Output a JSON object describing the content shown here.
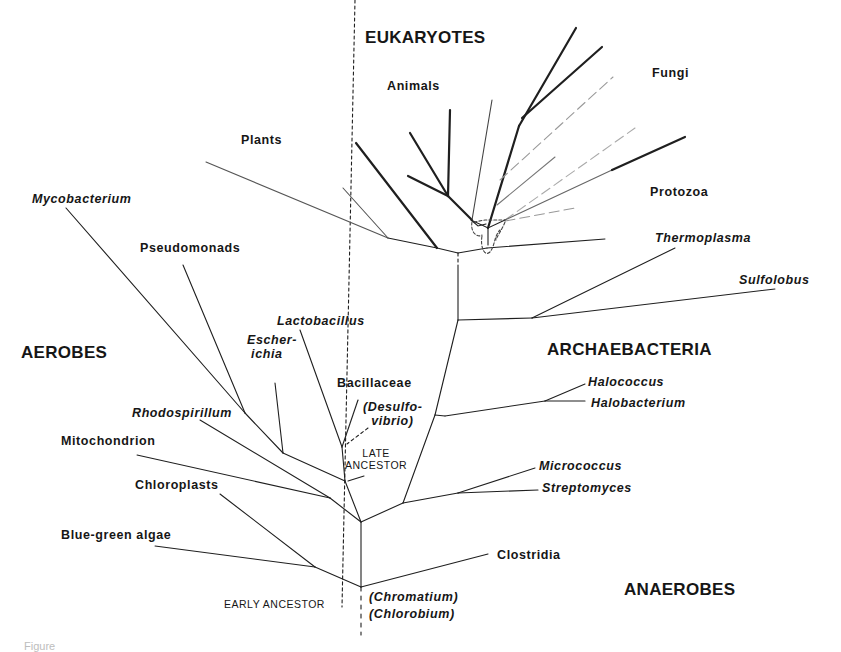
{
  "figure": {
    "groups": {
      "eukaryotes": "EUKARYOTES",
      "aerobes": "AEROBES",
      "archaebacteria": "ARCHAEBACTERIA",
      "anaerobes": "ANAEROBES"
    },
    "taxa": {
      "animals": "Animals",
      "fungi": "Fungi",
      "plants": "Plants",
      "protozoa": "Protozoa",
      "mycobacterium": "Mycobacterium",
      "pseudomonads": "Pseudomonads",
      "thermoplasma": "Thermoplasma",
      "sulfolobus": "Sulfolobus",
      "lactobacillus": "Lactobacillus",
      "escherichia": "Escher-\n ichia",
      "bacillaceae": "Bacillaceae",
      "desulfovibrio": "(Desulfo-\n  vibrio)",
      "halococcus": "Halococcus",
      "halobacterium": "Halobacterium",
      "rhodospirillum": "Rhodospirillum",
      "mitochondrion": "Mitochondrion",
      "chloroplasts": "Chloroplasts",
      "micrococcus": "Micrococcus",
      "streptomyces": "Streptomyces",
      "blue_green_algae": "Blue-green algae",
      "clostridia": "Clostridia",
      "chromatium": "(Chromatium)",
      "chlorobium": "(Chlorobium)"
    },
    "annotations": {
      "late_ancestor": "LATE\nANCESTOR",
      "early_ancestor": "EARLY ANCESTOR"
    },
    "caption_fragment": "Figure",
    "colors": {
      "line": "#1a1a1a",
      "thin_line": "#3a3a3a",
      "faint_line": "#8a8a8a",
      "text": "#161616"
    }
  }
}
